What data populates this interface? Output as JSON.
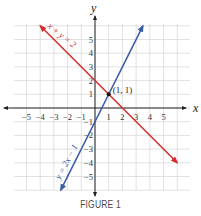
{
  "chart_data": {
    "type": "line",
    "title": "",
    "caption": "FIGURE 1",
    "xlabel": "x",
    "ylabel": "y",
    "xlim": [
      -6,
      6
    ],
    "ylim": [
      -6,
      6
    ],
    "grid": true,
    "x_ticks": [
      "-5",
      "-4",
      "-3",
      "-2",
      "-1",
      "1",
      "2",
      "3",
      "4",
      "5"
    ],
    "y_ticks": [
      "5",
      "4",
      "3",
      "2",
      "1",
      "-1",
      "-2",
      "-3",
      "-4",
      "-5"
    ],
    "series": [
      {
        "name": "x + y = 2",
        "color": "#d42e2a",
        "equation": "y = -x + 2",
        "x": [
          -4,
          6
        ],
        "y": [
          6,
          -4
        ]
      },
      {
        "name": "y = 2x − 1",
        "color": "#3b5ca8",
        "equation": "y = 2x - 1",
        "x": [
          -2.5,
          3.5
        ],
        "y": [
          -6,
          6
        ]
      }
    ],
    "annotations": [
      {
        "text": "(1, 1)",
        "x": 1,
        "y": 1,
        "marker": "point"
      }
    ]
  },
  "labels": {
    "x_axis": "x",
    "y_axis": "y",
    "point": "(1, 1)",
    "red_line": "x + y = 2",
    "blue_line": "y = 2x − 1",
    "caption": "FIGURE 1"
  }
}
